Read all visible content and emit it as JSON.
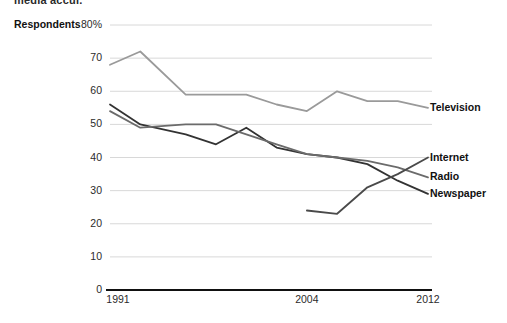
{
  "title_partial": "media accui.",
  "axis": {
    "y_title": "Respondents",
    "y_ticks": [
      "80%",
      "70",
      "60",
      "50",
      "40",
      "30",
      "20",
      "10",
      "0"
    ],
    "x_ticks": [
      "1991",
      "2004",
      "2012"
    ]
  },
  "legend": {
    "television": "Television",
    "internet": "Internet",
    "radio": "Radio",
    "newspaper": "Newspaper"
  },
  "colors": {
    "television": "#9a9a9a",
    "internet": "#4a4a4a",
    "radio": "#6b6b6b",
    "newspaper": "#333333",
    "gridline": "#d8d8d8",
    "axis": "#111111"
  },
  "chart_data": {
    "type": "line",
    "title": "media accui.",
    "xlabel": "",
    "ylabel": "Respondents",
    "ylim": [
      0,
      80
    ],
    "xlim": [
      1991,
      2012
    ],
    "grid": true,
    "legend_position": "right",
    "ytick_values": [
      80,
      70,
      60,
      50,
      40,
      30,
      20,
      10,
      0
    ],
    "xtick_values": [
      1991,
      2004,
      2012
    ],
    "series": [
      {
        "name": "Television",
        "color": "#9a9a9a",
        "x": [
          1991,
          1993,
          1996,
          1998,
          2000,
          2002,
          2004,
          2006,
          2008,
          2010,
          2012
        ],
        "values": [
          68,
          72,
          59,
          59,
          59,
          56,
          54,
          60,
          57,
          57,
          55
        ]
      },
      {
        "name": "Newspaper",
        "color": "#333333",
        "x": [
          1991,
          1993,
          1996,
          1998,
          2000,
          2002,
          2004,
          2006,
          2008,
          2010,
          2012
        ],
        "values": [
          56,
          50,
          47,
          44,
          49,
          43,
          41,
          40,
          38,
          33,
          29
        ]
      },
      {
        "name": "Radio",
        "color": "#6b6b6b",
        "x": [
          1991,
          1993,
          1996,
          1998,
          2000,
          2002,
          2004,
          2006,
          2008,
          2010,
          2012
        ],
        "values": [
          54,
          49,
          50,
          50,
          47,
          44,
          41,
          40,
          39,
          37,
          34
        ]
      },
      {
        "name": "Internet",
        "color": "#4a4a4a",
        "x": [
          2004,
          2006,
          2008,
          2010,
          2012
        ],
        "values": [
          24,
          23,
          31,
          35,
          40
        ]
      }
    ]
  }
}
